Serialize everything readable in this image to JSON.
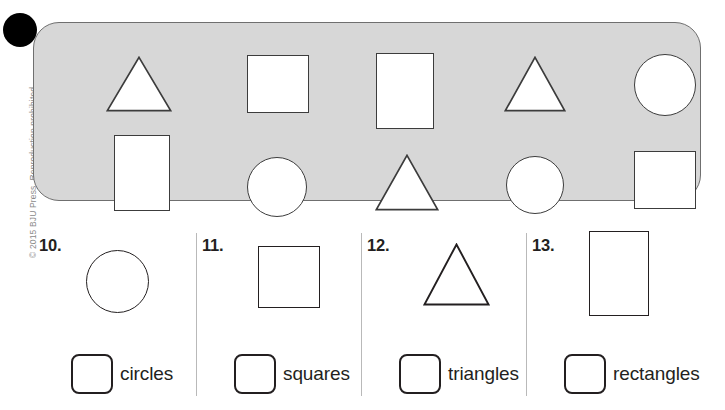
{
  "page": {
    "copyright": "© 2015 BJU Press. Reproduction prohibited.",
    "corner_marker": "black-dot"
  },
  "shape_bank": {
    "name": "shape-bank-panel",
    "fill_color": "#d7d7d7",
    "border_color": "#6f6f6f",
    "shape_fill": "#ffffff",
    "shape_outline": "#3c3c3c",
    "counts": {
      "circles": 3,
      "squares": 3,
      "triangles": 3,
      "rectangles": 2
    },
    "shapes": [
      {
        "id": 1,
        "type": "triangle",
        "row": "top",
        "x": 72,
        "y": 33,
        "w": 66,
        "h": 56
      },
      {
        "id": 2,
        "type": "square",
        "row": "top",
        "x": 213,
        "y": 32,
        "w": 62,
        "h": 58
      },
      {
        "id": 3,
        "type": "rectangle",
        "row": "top",
        "x": 342,
        "y": 30,
        "w": 58,
        "h": 76
      },
      {
        "id": 4,
        "type": "triangle",
        "row": "top",
        "x": 470,
        "y": 33,
        "w": 62,
        "h": 56
      },
      {
        "id": 5,
        "type": "circle",
        "row": "top",
        "x": 600,
        "y": 31,
        "w": 62,
        "h": 62
      },
      {
        "id": 6,
        "type": "rectangle",
        "row": "bottom",
        "x": 80,
        "y": 112,
        "w": 56,
        "h": 76
      },
      {
        "id": 7,
        "type": "circle",
        "row": "bottom",
        "x": 213,
        "y": 134,
        "w": 60,
        "h": 60
      },
      {
        "id": 8,
        "type": "triangle",
        "row": "bottom",
        "x": 341,
        "y": 131,
        "w": 64,
        "h": 57
      },
      {
        "id": 9,
        "type": "circle",
        "row": "bottom",
        "x": 472,
        "y": 133,
        "w": 58,
        "h": 58
      },
      {
        "id": 10,
        "type": "square",
        "row": "bottom",
        "x": 600,
        "y": 128,
        "w": 62,
        "h": 58
      }
    ]
  },
  "questions": [
    {
      "number": "10.",
      "shape_type": "circle",
      "answer_label": "circles",
      "answer_value": "",
      "cell_x": 0,
      "cell_w": 163,
      "divider": false,
      "figure": {
        "x": 53,
        "y": 22,
        "w": 63,
        "h": 63
      }
    },
    {
      "number": "11.",
      "shape_type": "square",
      "answer_label": "squares",
      "answer_value": "",
      "cell_x": 163,
      "cell_w": 165,
      "divider": true,
      "figure": {
        "x": 62,
        "y": 18,
        "w": 62,
        "h": 62
      }
    },
    {
      "number": "12.",
      "shape_type": "triangle",
      "answer_label": "triangles",
      "answer_value": "",
      "cell_x": 328,
      "cell_w": 165,
      "divider": true,
      "figure": {
        "x": 62,
        "y": 15,
        "w": 67,
        "h": 63
      }
    },
    {
      "number": "13.",
      "shape_type": "rectangle",
      "answer_label": "rectangles",
      "answer_value": "",
      "cell_x": 493,
      "cell_w": 199,
      "divider": true,
      "figure": {
        "x": 63,
        "y": 3,
        "w": 60,
        "h": 85
      }
    }
  ]
}
